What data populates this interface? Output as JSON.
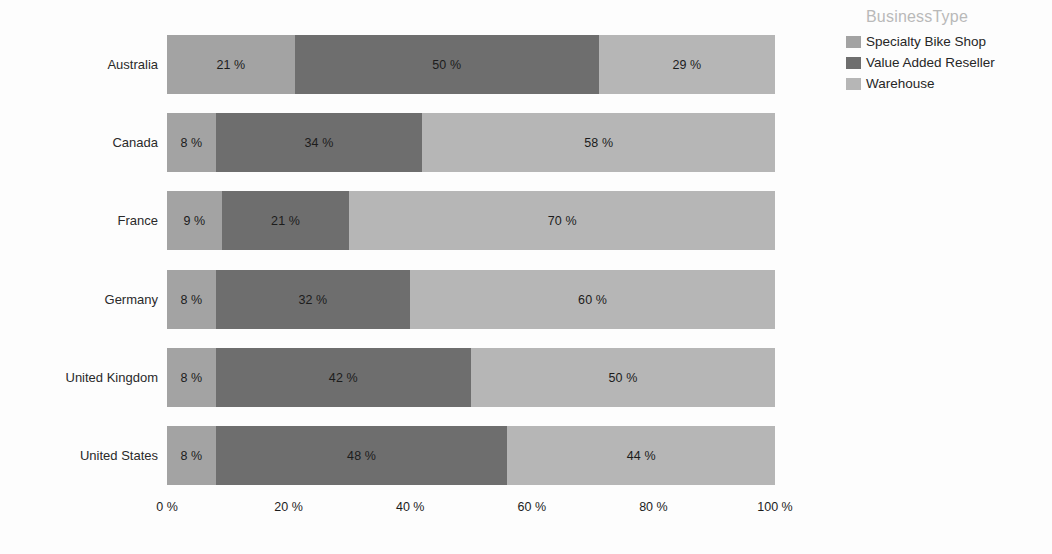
{
  "chart_data": {
    "type": "bar",
    "subtype": "stacked-bar-100-horizontal",
    "orientation": "horizontal",
    "title": "",
    "xlabel": "",
    "ylabel": "",
    "xlim": [
      0,
      100
    ],
    "grid": false,
    "legend_position": "right",
    "legend_title": "BusinessType",
    "categories": [
      "Australia",
      "Canada",
      "France",
      "Germany",
      "United Kingdom",
      "United States"
    ],
    "series": [
      {
        "name": "Specialty Bike Shop",
        "color": "#a3a3a3",
        "values": [
          21,
          8,
          9,
          8,
          8,
          8
        ],
        "labels": [
          "21 %",
          "8 %",
          "9 %",
          "8 %",
          "8 %",
          "8 %"
        ]
      },
      {
        "name": "Value Added Reseller",
        "color": "#6e6e6e",
        "values": [
          50,
          34,
          21,
          32,
          42,
          48
        ],
        "labels": [
          "50 %",
          "34 %",
          "21 %",
          "32 %",
          "42 %",
          "48 %"
        ]
      },
      {
        "name": "Warehouse",
        "color": "#b6b6b6",
        "values": [
          29,
          58,
          70,
          60,
          50,
          44
        ],
        "labels": [
          "29 %",
          "58 %",
          "70 %",
          "60 %",
          "50 %",
          "44 %"
        ]
      }
    ],
    "x_ticks": [
      {
        "value": 0,
        "label": "0 %"
      },
      {
        "value": 20,
        "label": "20 %"
      },
      {
        "value": 40,
        "label": "40 %"
      },
      {
        "value": 60,
        "label": "60 %"
      },
      {
        "value": 80,
        "label": "80 %"
      },
      {
        "value": 100,
        "label": "100 %"
      }
    ]
  },
  "colors": {
    "background": "#fdfdfd",
    "legend_title": "#b9b9b9",
    "axis_text": "#1c1c1c",
    "category_text": "#2a2a2a"
  }
}
